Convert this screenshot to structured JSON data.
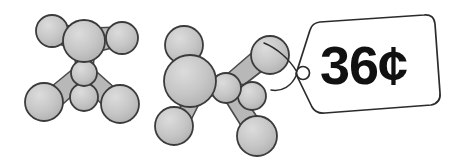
{
  "figure": {
    "title": "Ball-and-stick molecular models with price tag",
    "background_color": "#ffffff",
    "width": 449,
    "height": 164
  },
  "palette": {
    "atom_fill": "#c9c9c9",
    "atom_stroke": "#3b3b3b",
    "bond_fill": "#b8b8b8",
    "bond_stroke": "#4a4a4a",
    "tag_fill": "#ffffff",
    "tag_stroke": "#2b2b2b",
    "text_color": "#111111",
    "string_color": "#2b2b2b"
  },
  "price_tag": {
    "price_label": "36¢",
    "currency_symbol": "¢",
    "amount": "36",
    "hole_label": "tag-hole",
    "string_label": "tag-string"
  },
  "molecules": [
    {
      "id": "molecule-left",
      "label": "left molecule model",
      "atom_count": 6,
      "atoms": [
        {
          "id": "left-atom-center-upper",
          "cx": 84,
          "cy": 41,
          "r": 21
        },
        {
          "id": "left-atom-center-lower",
          "cx": 84,
          "cy": 73,
          "r": 13
        },
        {
          "id": "left-atom-upper-left",
          "cx": 52,
          "cy": 31,
          "r": 16
        },
        {
          "id": "left-atom-upper-right",
          "cx": 122,
          "cy": 38,
          "r": 16
        },
        {
          "id": "left-atom-lower-left",
          "cx": 44,
          "cy": 102,
          "r": 19
        },
        {
          "id": "left-atom-lower-right",
          "cx": 120,
          "cy": 104,
          "r": 19
        },
        {
          "id": "left-atom-bottom-center",
          "cx": 84,
          "cy": 97,
          "r": 14
        }
      ],
      "bonds": [
        {
          "id": "left-bond-1",
          "from": "left-atom-center-upper",
          "to": "left-atom-upper-left"
        },
        {
          "id": "left-bond-2",
          "from": "left-atom-center-upper",
          "to": "left-atom-upper-right"
        },
        {
          "id": "left-bond-3",
          "from": "left-atom-center-upper",
          "to": "left-atom-center-lower"
        },
        {
          "id": "left-bond-4",
          "from": "left-atom-center-lower",
          "to": "left-atom-lower-left"
        },
        {
          "id": "left-bond-5",
          "from": "left-atom-center-lower",
          "to": "left-atom-lower-right"
        },
        {
          "id": "left-bond-6",
          "from": "left-atom-center-lower",
          "to": "left-atom-bottom-center"
        }
      ]
    },
    {
      "id": "molecule-right",
      "label": "right molecule model with price tag",
      "atom_count": 7,
      "atoms": [
        {
          "id": "right-atom-big-left",
          "cx": 190,
          "cy": 81,
          "r": 26
        },
        {
          "id": "right-atom-top-left",
          "cx": 184,
          "cy": 45,
          "r": 19
        },
        {
          "id": "right-atom-center",
          "cx": 226,
          "cy": 88,
          "r": 15
        },
        {
          "id": "right-atom-small-right",
          "cx": 252,
          "cy": 96,
          "r": 14
        },
        {
          "id": "right-atom-upper-right",
          "cx": 270,
          "cy": 55,
          "r": 19
        },
        {
          "id": "right-atom-lower-left",
          "cx": 174,
          "cy": 126,
          "r": 19
        },
        {
          "id": "right-atom-lower-right",
          "cx": 257,
          "cy": 136,
          "r": 20
        }
      ],
      "bonds": [
        {
          "id": "right-bond-1",
          "from": "right-atom-big-left",
          "to": "right-atom-top-left"
        },
        {
          "id": "right-bond-2",
          "from": "right-atom-big-left",
          "to": "right-atom-center"
        },
        {
          "id": "right-bond-3",
          "from": "right-atom-center",
          "to": "right-atom-upper-right"
        },
        {
          "id": "right-bond-4",
          "from": "right-atom-center",
          "to": "right-atom-small-right"
        },
        {
          "id": "right-bond-5",
          "from": "right-atom-big-left",
          "to": "right-atom-lower-left"
        },
        {
          "id": "right-bond-6",
          "from": "right-atom-center",
          "to": "right-atom-lower-right"
        }
      ]
    }
  ]
}
